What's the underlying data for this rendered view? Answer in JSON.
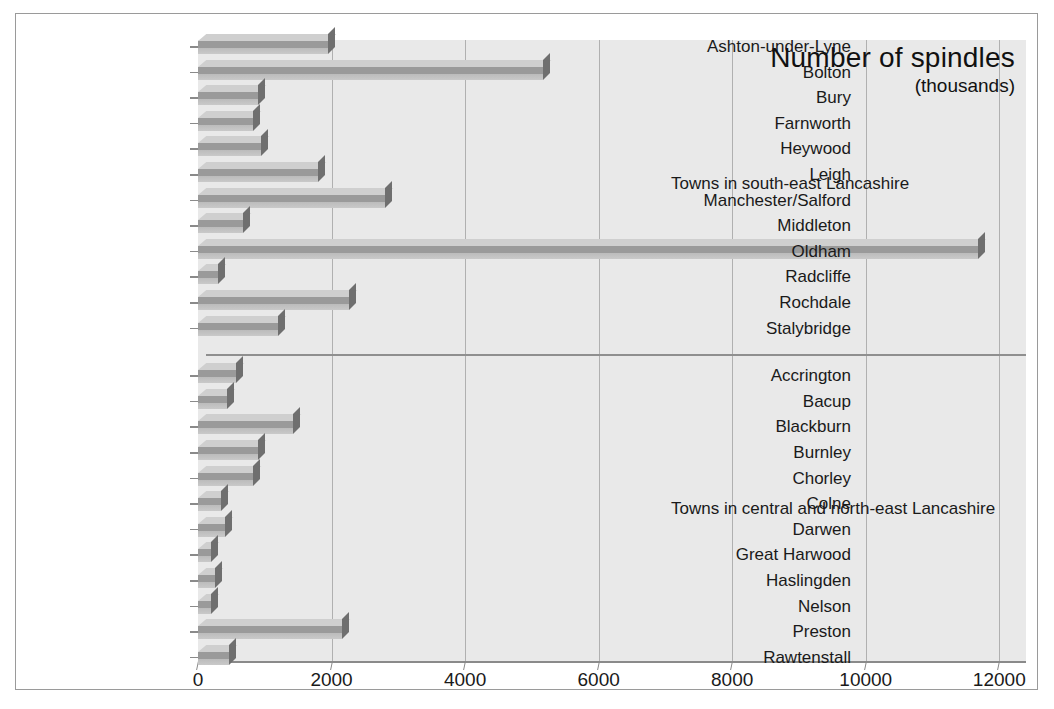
{
  "chart_data": {
    "type": "bar",
    "orientation": "horizontal",
    "title": "Number of spindles",
    "subtitle": "(thousands)",
    "xlabel": "",
    "ylabel": "",
    "xlim": [
      0,
      12400
    ],
    "xticks": [
      0,
      2000,
      4000,
      6000,
      8000,
      10000,
      12000
    ],
    "xticklabels": [
      "0",
      "2000",
      "4000",
      "6000",
      "8000",
      "10000",
      "12000"
    ],
    "grid": "vertical",
    "legend": "none",
    "groups": [
      {
        "annotation": "Towns in south-east Lancashire",
        "categories": [
          "Ashton-under-Lyne",
          "Bolton",
          "Bury",
          "Farnworth",
          "Heywood",
          "Leigh",
          "Manchester/Salford",
          "Middleton",
          "Oldham",
          "Radcliffe",
          "Rochdale",
          "Stalybridge"
        ],
        "values": [
          1950,
          5160,
          900,
          830,
          950,
          1800,
          2800,
          670,
          11680,
          300,
          2260,
          1200
        ]
      },
      {
        "annotation": "Towns in central and north-east Lancashire",
        "categories": [
          "Accrington",
          "Bacup",
          "Blackburn",
          "Burnley",
          "Chorley",
          "Colne",
          "Darwen",
          "Great Harwood",
          "Haslingden",
          "Nelson",
          "Preston",
          "Rawtenstall"
        ],
        "values": [
          570,
          430,
          1420,
          900,
          830,
          350,
          400,
          200,
          250,
          200,
          2150,
          470
        ]
      }
    ],
    "colors": {
      "bar_face": "#9a9a9a",
      "bar_top": "#cfcfcf",
      "bar_cap": "#6f6f6f",
      "plot_background": "#e9e9e9",
      "gridline": "#b0b0b0",
      "axis": "#8a8a8a",
      "text": "#1a1a1a",
      "border": "#9a9a9a"
    }
  }
}
